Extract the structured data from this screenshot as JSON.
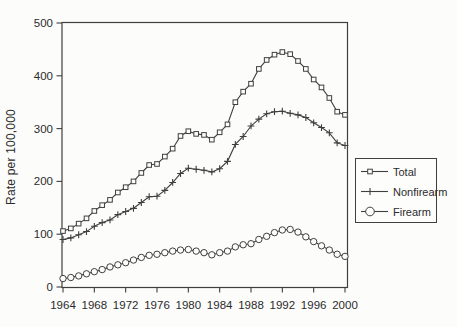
{
  "figure": {
    "background": "#fcfcfb",
    "ink_color": "#3f3f3f",
    "text_color": "#2b2b2b",
    "marker_fill": "#fdfdfc"
  },
  "chart_data": {
    "type": "line",
    "title": "",
    "xlabel": "",
    "ylabel": "Rate per 100,000",
    "xlim": [
      1964,
      2000
    ],
    "ylim": [
      0,
      500
    ],
    "xticks": [
      1964,
      1968,
      1972,
      1976,
      1980,
      1984,
      1988,
      1992,
      1996,
      2000
    ],
    "yticks": [
      0,
      100,
      200,
      300,
      400,
      500
    ],
    "grid": false,
    "legend_position": "right",
    "x": [
      1964,
      1965,
      1966,
      1967,
      1968,
      1969,
      1970,
      1971,
      1972,
      1973,
      1974,
      1975,
      1976,
      1977,
      1978,
      1979,
      1980,
      1981,
      1982,
      1983,
      1984,
      1985,
      1986,
      1987,
      1988,
      1989,
      1990,
      1991,
      1992,
      1993,
      1994,
      1995,
      1996,
      1997,
      1998,
      1999,
      2000
    ],
    "series": [
      {
        "name": "Total",
        "marker": "square",
        "values": [
          106,
          111,
          120,
          130,
          144,
          155,
          165,
          179,
          189,
          200,
          216,
          231,
          233,
          247,
          262,
          286,
          295,
          290,
          288,
          279,
          293,
          308,
          350,
          370,
          385,
          413,
          430,
          440,
          445,
          441,
          428,
          413,
          393,
          378,
          358,
          332,
          326
        ]
      },
      {
        "name": "Nonfirearm",
        "marker": "plus",
        "values": [
          90,
          93,
          99,
          105,
          115,
          122,
          127,
          137,
          143,
          149,
          160,
          171,
          172,
          183,
          198,
          215,
          225,
          223,
          221,
          218,
          224,
          238,
          270,
          285,
          305,
          318,
          328,
          332,
          333,
          329,
          326,
          321,
          311,
          302,
          292,
          273,
          268
        ]
      },
      {
        "name": "Firearm",
        "marker": "circle",
        "values": [
          16,
          18,
          21,
          25,
          29,
          33,
          38,
          42,
          46,
          51,
          56,
          60,
          62,
          65,
          68,
          70,
          71,
          68,
          65,
          61,
          65,
          68,
          76,
          80,
          82,
          90,
          96,
          103,
          108,
          109,
          104,
          95,
          86,
          78,
          70,
          62,
          58
        ]
      }
    ]
  }
}
